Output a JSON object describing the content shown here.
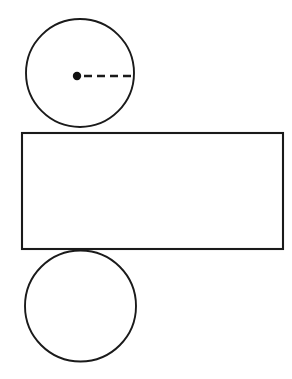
{
  "figure": {
    "background_color": "#ffffff",
    "stroke_color": "#1a1a1a",
    "fill_color": "#ffffff",
    "dot_color": "#111111",
    "canvas": {
      "width": 292,
      "height": 379
    }
  },
  "shapes": {
    "top_circle": {
      "name": "top base circle",
      "center_x": 80,
      "center_y": 73,
      "radius": 54,
      "left": 26,
      "right": 134,
      "top": 19,
      "bottom": 127,
      "stroke_width": 1.9
    },
    "bottom_circle": {
      "name": "bottom base circle",
      "center_x": 80.5,
      "center_y": 306,
      "radius": 55.5,
      "left": 25,
      "right": 136,
      "top": 250,
      "bottom": 361,
      "stroke_width": 1.9
    },
    "rectangle": {
      "name": "lateral surface rectangle",
      "x": 22,
      "y": 133,
      "width": 261,
      "height": 116,
      "right": 283,
      "bottom": 249,
      "stroke_width": 2.1
    },
    "center_point": {
      "name": "circle center point",
      "cx": 77,
      "cy": 76,
      "r": 4.2
    },
    "radius_line": {
      "name": "dashed radius segment",
      "x1": 84,
      "y1": 76,
      "x2": 133,
      "y2": 76,
      "dash_pattern": "8 5",
      "dash_count": 4,
      "stroke_width": 2.6
    }
  }
}
